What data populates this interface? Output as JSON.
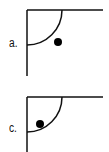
{
  "panels": [
    {
      "id": "a",
      "label": "a.",
      "corner": {
        "x": 27,
        "y": 10
      },
      "line_end_x": 103,
      "line_end_y": 76,
      "arc_radius": 35,
      "ball": {
        "cx": 58,
        "cy": 42,
        "r": 4
      }
    },
    {
      "id": "c",
      "label": "c.",
      "corner": {
        "x": 27,
        "y": 97
      },
      "line_end_x": 103,
      "line_end_y": 152,
      "arc_radius": 35,
      "ball": {
        "cx": 40,
        "cy": 124,
        "r": 4
      }
    }
  ],
  "colors": {
    "stroke": "#111111",
    "ball": "#000000",
    "background": "#ffffff"
  }
}
